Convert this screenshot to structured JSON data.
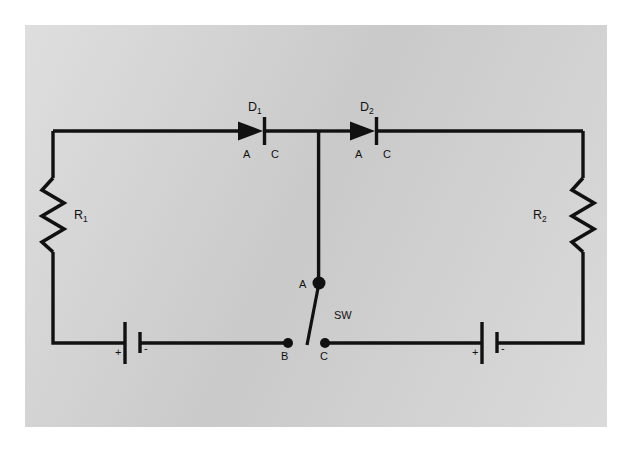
{
  "diagram": {
    "background_color": "#d0d0d0",
    "line_color": "#111111",
    "components": {
      "diode1": {
        "name": "D",
        "subscript": "1",
        "anode": "A",
        "cathode": "C"
      },
      "diode2": {
        "name": "D",
        "subscript": "2",
        "anode": "A",
        "cathode": "C"
      },
      "resistor1": {
        "name": "R",
        "subscript": "1"
      },
      "resistor2": {
        "name": "R",
        "subscript": "2"
      },
      "battery_left": {
        "positive": "+",
        "negative": "-"
      },
      "battery_right": {
        "positive": "+",
        "negative": "-"
      },
      "switch": {
        "name": "SW",
        "terminal_pivot": "A",
        "terminal_left": "B",
        "terminal_right": "C"
      }
    }
  }
}
